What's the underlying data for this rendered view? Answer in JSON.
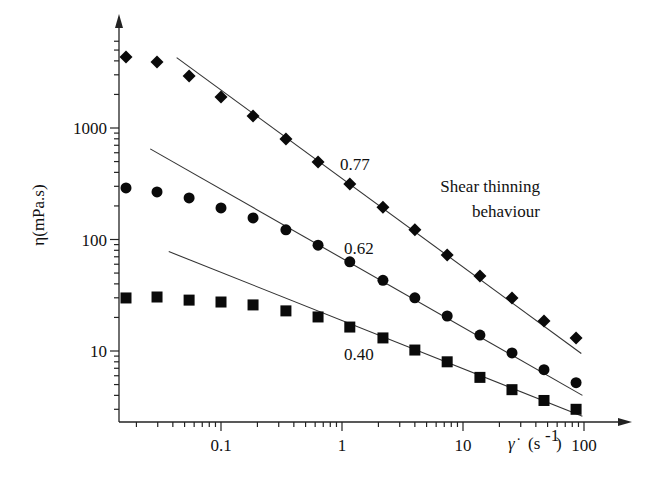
{
  "chart_data": {
    "type": "scatter",
    "title": "",
    "xlabel": "γ̇ (s⁻¹)",
    "ylabel": "η(mPa.s)",
    "xscale": "log",
    "yscale": "log",
    "xlim": [
      0.015,
      200
    ],
    "ylim": [
      2.5,
      8000
    ],
    "grid": false,
    "legend": null,
    "x_ticks": [
      {
        "value": 0.1,
        "label": "0.1"
      },
      {
        "value": 1,
        "label": "1"
      },
      {
        "value": 10,
        "label": "10"
      },
      {
        "value": 100,
        "label": "100"
      }
    ],
    "y_ticks": [
      {
        "value": 10,
        "label": "10"
      },
      {
        "value": 100,
        "label": "100"
      },
      {
        "value": 1000,
        "label": "1000"
      }
    ],
    "series": [
      {
        "name": "diamond",
        "marker": "diamond",
        "x": [
          0.0164,
          0.0296,
          0.0545,
          0.1,
          0.184,
          0.344,
          0.634,
          1.16,
          2.18,
          4.0,
          7.4,
          13.8,
          25.4,
          46.7,
          86
        ],
        "values": [
          4330,
          3900,
          2930,
          1900,
          1280,
          797,
          495,
          315,
          195,
          122,
          72.6,
          47,
          29.9,
          18.6,
          13.1
        ],
        "fit": {
          "exponent_label": "0.77",
          "x": [
            0.043,
            95
          ],
          "y": [
            4280,
            9.5
          ]
        }
      },
      {
        "name": "circle",
        "marker": "circle",
        "x": [
          0.0164,
          0.0296,
          0.0545,
          0.1,
          0.184,
          0.344,
          0.634,
          1.16,
          2.18,
          4.0,
          7.4,
          13.8,
          25.4,
          46.7,
          86
        ],
        "values": [
          290,
          267,
          236,
          192,
          156,
          122,
          89,
          63,
          43,
          30,
          20.6,
          13.9,
          9.6,
          6.8,
          5.2
        ],
        "fit": {
          "exponent_label": "0.62",
          "x": [
            0.026,
            97
          ],
          "y": [
            650,
            4.0
          ]
        }
      },
      {
        "name": "square",
        "marker": "square",
        "x": [
          0.0164,
          0.0296,
          0.0545,
          0.1,
          0.184,
          0.344,
          0.634,
          1.16,
          2.18,
          4.0,
          7.4,
          13.8,
          25.4,
          46.7,
          86
        ],
        "values": [
          29.9,
          30.5,
          28.6,
          27.5,
          25.9,
          22.9,
          20.2,
          16.4,
          13.1,
          10.2,
          8.0,
          5.8,
          4.5,
          3.6,
          3.0
        ],
        "fit": {
          "exponent_label": "0.40",
          "x": [
            0.037,
            97
          ],
          "y": [
            78,
            2.6
          ]
        }
      }
    ],
    "annotations": [
      {
        "text": "0.77",
        "x_px": 340,
        "y_px": 170
      },
      {
        "text": "0.62",
        "x_px": 344,
        "y_px": 254
      },
      {
        "text": "0.40",
        "x_px": 344,
        "y_px": 360
      },
      {
        "text": "Shear thinning",
        "x_px": 540,
        "y_px": 192,
        "anchor": "end"
      },
      {
        "text": "behaviour",
        "x_px": 540,
        "y_px": 217,
        "anchor": "end"
      }
    ]
  },
  "layout": {
    "origin_px": [
      119,
      422
    ],
    "x_decade_px": 121,
    "x_ref": {
      "value": 1,
      "px": 342
    },
    "y_decade_px": 111.5,
    "y_ref": {
      "value": 1000,
      "px": 128
    },
    "x_axis_end_px": 632,
    "y_axis_top_px": 14
  },
  "labels": {
    "x_axis_symbol": "γ̇",
    "x_axis_unit": "(s",
    "x_axis_exp": "-1",
    "x_axis_close": ")",
    "y_axis": "η(mPa.s)"
  },
  "colors": {
    "marker": "#0a0a0a",
    "line": "#333333",
    "axis": "#222222",
    "background": "#ffffff"
  }
}
